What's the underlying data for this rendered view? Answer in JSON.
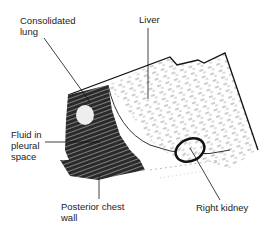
{
  "figure": {
    "type": "labeled ultrasound schematic",
    "labels": [
      {
        "id": "consolidated-lung",
        "text": "Consolidated\nlung"
      },
      {
        "id": "liver",
        "text": "Liver"
      },
      {
        "id": "fluid-pleural",
        "text": "Fluid in\npleural\nspace"
      },
      {
        "id": "posterior-chest-wall",
        "text": "Posterior chest\nwall"
      },
      {
        "id": "right-kidney",
        "text": "Right kidney"
      }
    ]
  }
}
